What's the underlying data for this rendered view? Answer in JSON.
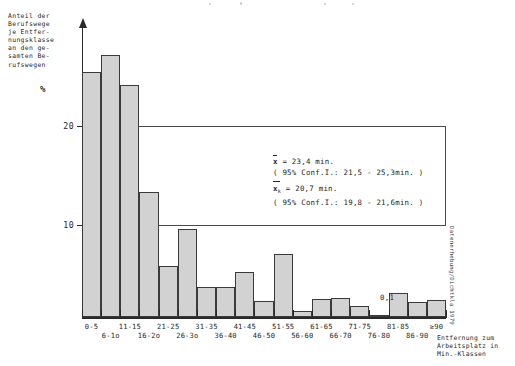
{
  "chart_data": {
    "type": "bar",
    "title": "",
    "ylabel": "Anteil der Berufswege je Entfernungsklasse an den gesamten Berufswegen",
    "yunit": "%",
    "xlabel": "Entfernung zum Arbeitsplatz in Min.-Klassen",
    "ylim": [
      0,
      24
    ],
    "yticks": [
      10,
      20
    ],
    "ytick_labels": [
      "10",
      "20"
    ],
    "grid": true,
    "legend": null,
    "categories": [
      "0-5",
      "6-1o",
      "11-15",
      "16-2o",
      "21-25",
      "26-3o",
      "31-35",
      "36-40",
      "41-45",
      "46-50",
      "51-55",
      "56-60",
      "61-65",
      "66-70",
      "71-75",
      "76-80",
      "81-85",
      "86-90",
      "≥90"
    ],
    "values": [
      20.2,
      21.6,
      19.1,
      10.3,
      4.2,
      7.3,
      2.5,
      2.5,
      3.7,
      1.3,
      5.2,
      0.5,
      1.5,
      1.6,
      0.9,
      0.1,
      2.0,
      1.2,
      1.4
    ],
    "annotations": [
      {
        "x": "76-80",
        "value": "0,1"
      }
    ],
    "stats": {
      "mean_label": "x",
      "mean_value": "= 23,4 min.",
      "mean_ci": "( 95% Conf.I.: 21,5 - 25,3min. )",
      "mean_k_label": "x",
      "mean_k_sub": "k",
      "mean_k_value": "= 20,7 min.",
      "mean_k_ci": "( 95% Conf.I.: 19,8 - 21,6min. )"
    }
  },
  "axes": {
    "y_caption": "Anteil der\nBerufswege\nje Entfer-\nnungsklasse\nan den ge-\nsamten Be-\nrufswegen",
    "y_unit": "%",
    "x_title": "Entfernung zum\nArbeitsplatz in\nMin.-Klassen"
  },
  "source": {
    "note": "Datenerhebung/Dichtkla 1979"
  },
  "colors": {
    "bar_fill": "#d2d2d2",
    "bar_stroke": "#3b3b3b",
    "axis": "#2a2a2a",
    "grid": "#4a4a4a",
    "text": "#262626"
  }
}
